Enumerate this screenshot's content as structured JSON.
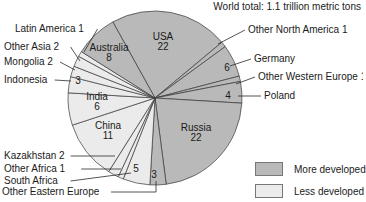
{
  "chart_data": {
    "type": "pie",
    "title": "World total: 1.1 trillion metric tons",
    "start_angle_deg": -29,
    "direction": "clockwise",
    "colors": {
      "more_developed": "#b9b9b9",
      "less_developed": "#ebebeb",
      "stroke": "#3a3a3a"
    },
    "legend": [
      {
        "key": "more_developed",
        "label": "More developed"
      },
      {
        "key": "less_developed",
        "label": "Less developed"
      }
    ],
    "slices": [
      {
        "label": "USA",
        "value": 22,
        "group": "more_developed",
        "inside": true,
        "lx": 163,
        "ly": 40
      },
      {
        "label": "Other North America",
        "value": 1,
        "group": "more_developed",
        "inside": false,
        "text": "Other North America 1",
        "tx": 248,
        "ty": 33,
        "ax": 218,
        "ay": 44
      },
      {
        "label": "Germany",
        "value": 6,
        "group": "more_developed",
        "inside": false,
        "text": "Germany",
        "tx": 254,
        "ty": 62,
        "ax": 230,
        "ay": 66,
        "num": "6",
        "nx": 227,
        "ny": 71
      },
      {
        "label": "Other Western Europe",
        "value": 1,
        "group": "more_developed",
        "inside": false,
        "text": "Other Western Europe 1",
        "tx": 258,
        "ty": 80,
        "ax": 236,
        "ay": 84
      },
      {
        "label": "Poland",
        "value": 4,
        "group": "more_developed",
        "inside": false,
        "text": "Poland",
        "tx": 264,
        "ty": 99,
        "ax": 238,
        "ay": 96,
        "num": "4",
        "nx": 228,
        "ny": 99
      },
      {
        "label": "Russia",
        "value": 22,
        "group": "more_developed",
        "inside": true,
        "lx": 196,
        "ly": 131
      },
      {
        "label": "Other Eastern Europe",
        "value": 3,
        "group": "more_developed",
        "inside": false,
        "text": "Other Eastern Europe",
        "tx": 2,
        "ty": 195,
        "ax": 156,
        "ay": 181,
        "num": "3",
        "nx": 154,
        "ny": 178,
        "elbow": true
      },
      {
        "label": "South Africa",
        "value": 5,
        "group": "less_developed",
        "inside": false,
        "text": "South Africa",
        "tx": 4,
        "ty": 184,
        "ax": 131,
        "ay": 173,
        "num": "5",
        "nx": 136,
        "ny": 172
      },
      {
        "label": "Other Africa",
        "value": 1,
        "group": "less_developed",
        "inside": false,
        "text": "Other Africa 1",
        "tx": 4,
        "ty": 172,
        "ax": 121,
        "ay": 169
      },
      {
        "label": "Kazakhstan",
        "value": 2,
        "group": "less_developed",
        "inside": false,
        "text": "Kazakhstan 2",
        "tx": 4,
        "ty": 159,
        "ax": 115,
        "ay": 156
      },
      {
        "label": "China",
        "value": 11,
        "group": "less_developed",
        "inside": true,
        "lx": 108,
        "ly": 129
      },
      {
        "label": "India",
        "value": 6,
        "group": "less_developed",
        "inside": true,
        "lx": 97,
        "ly": 100
      },
      {
        "label": "Indonesia",
        "value": 3,
        "group": "less_developed",
        "inside": false,
        "text": "Indonesia",
        "tx": 4,
        "ty": 83,
        "ax": 71,
        "ay": 81,
        "num": "3",
        "nx": 78,
        "ny": 84
      },
      {
        "label": "Mongolia",
        "value": 2,
        "group": "less_developed",
        "inside": false,
        "text": "Mongolia 2",
        "tx": 4,
        "ty": 65,
        "ax": 75,
        "ay": 70
      },
      {
        "label": "Other Asia",
        "value": 2,
        "group": "less_developed",
        "inside": false,
        "text": "Other Asia 2",
        "tx": 4,
        "ty": 50,
        "ax": 80,
        "ay": 61
      },
      {
        "label": "Latin America",
        "value": 1,
        "group": "less_developed",
        "inside": false,
        "text": "Latin America 1",
        "tx": 15,
        "ty": 32,
        "ax": 84,
        "ay": 52
      },
      {
        "label": "Australia",
        "value": 8,
        "group": "more_developed",
        "inside": true,
        "lx": 109,
        "ly": 51
      }
    ]
  },
  "title": "World total: 1.1 trillion metric tons",
  "legend": {
    "more": "More developed",
    "less": "Less developed"
  }
}
